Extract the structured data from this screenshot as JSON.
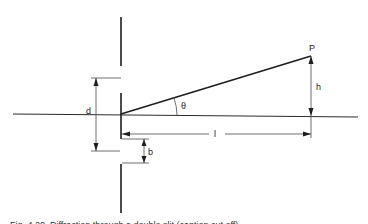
{
  "figure": {
    "labels": {
      "point": "P",
      "height": "h",
      "angle": "θ",
      "distance": "l",
      "slit_separation": "d",
      "slit_width": "b"
    },
    "caption": "Fig. 4.20. Diffraction through a double slit (caption cut off)"
  }
}
